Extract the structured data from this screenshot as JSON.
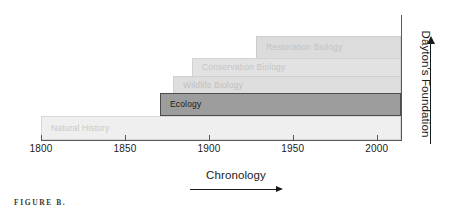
{
  "figure": {
    "caption": "FIGURE B.",
    "background": "#ffffff"
  },
  "axes": {
    "x": {
      "label": "Chronology",
      "arrow": "right-arrow",
      "ticks": [
        {
          "value": 1800,
          "label": "1800"
        },
        {
          "value": 1850,
          "label": "1850"
        },
        {
          "value": 1900,
          "label": "1900"
        },
        {
          "value": 1950,
          "label": "1950"
        },
        {
          "value": 2000,
          "label": "2000"
        }
      ],
      "range": [
        1800,
        2015
      ],
      "color": "#58585a"
    },
    "y": {
      "label": "Dayton's Foundation",
      "arrow": "up-arrow",
      "color": "#58585a"
    }
  },
  "chart_data": {
    "type": "bar",
    "orientation": "horizontal",
    "title": "",
    "xlabel": "Chronology",
    "ylabel": "Dayton's Foundation",
    "xlim": [
      1800,
      2015
    ],
    "grid": false,
    "legend": "none",
    "categories": [
      "Natural History",
      "Ecology",
      "Wildlife Biology",
      "Conservation Biology",
      "Restoration Biology"
    ],
    "bars": [
      {
        "label": "Natural History",
        "start": 1805,
        "end": 2015,
        "level": 1,
        "fill": "#efefef",
        "border": "#d8d8d8",
        "text_color": "#c9c9c9",
        "highlighted": false
      },
      {
        "label": "Ecology",
        "start": 1875,
        "end": 2015,
        "level": 2,
        "fill": "#9d9d9d",
        "border": "#4c4c4c",
        "text_color": "#1a1a1a",
        "highlighted": true
      },
      {
        "label": "Wildlife Biology",
        "start": 1882,
        "end": 2015,
        "level": 3,
        "fill": "#dedede",
        "border": "#cfcfcf",
        "text_color": "#c0c0c0",
        "highlighted": false
      },
      {
        "label": "Conservation Biology",
        "start": 1893,
        "end": 2015,
        "level": 4,
        "fill": "#e2e2e2",
        "border": "#d2d2d2",
        "text_color": "#c4c4c4",
        "highlighted": false
      },
      {
        "label": "Restoration Biology",
        "start": 1931,
        "end": 2015,
        "level": 5,
        "fill": "#dcdcdc",
        "border": "#cccccc",
        "text_color": "#c2c2c2",
        "highlighted": false
      }
    ]
  },
  "colors": {
    "axis": "#58585a",
    "text": "#1a1a1a",
    "highlight_fill": "#9d9d9d",
    "highlight_border": "#4c4c4c"
  }
}
